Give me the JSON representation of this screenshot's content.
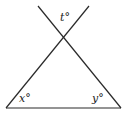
{
  "diagram": {
    "type": "geometry",
    "colors": {
      "stroke": "#2a2a2a",
      "background": "#ffffff",
      "text": "#222222"
    },
    "labels": {
      "top_angle": "t°",
      "left_angle": "x°",
      "right_angle": "y°"
    },
    "points": {
      "intersection": [
        63,
        39
      ],
      "left_base": [
        6,
        108
      ],
      "right_base": [
        121,
        108
      ],
      "left_line_top": [
        38,
        6
      ],
      "right_line_top": [
        89,
        6
      ]
    }
  }
}
